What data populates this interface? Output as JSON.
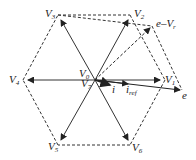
{
  "diagram": {
    "type": "space vector hexagon",
    "center_labels": {
      "v0": "V",
      "v0_sub": "0",
      "v7": "V",
      "v7_sub": "7"
    },
    "vertices": [
      {
        "name": "V",
        "sub": "1"
      },
      {
        "name": "V",
        "sub": "2"
      },
      {
        "name": "V",
        "sub": "3"
      },
      {
        "name": "V",
        "sub": "4"
      },
      {
        "name": "V",
        "sub": "5"
      },
      {
        "name": "V",
        "sub": "6"
      }
    ],
    "vectors": {
      "i": "i",
      "i_ref": "i",
      "i_ref_sub": "ref",
      "e": "e",
      "e_minus_vr": "e–V",
      "e_minus_vr_sub": "r"
    },
    "colors": {
      "line": "#333333",
      "background": "#ffffff"
    }
  }
}
